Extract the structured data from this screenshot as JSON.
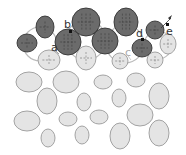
{
  "colors": {
    "background": "#ffffff",
    "dark_fill": "#6b6b6b",
    "dark_stroke": "#333333",
    "light_fill": "#e4e4e4",
    "light_stroke": "#9a9a9a",
    "ring_stroke": "#bbbbbb",
    "dash": "#444444",
    "light_dash": "#888888"
  },
  "labels": {
    "a": "a",
    "b": "b",
    "c": "c",
    "d": "d",
    "e": "e"
  },
  "dark_ellipses": [
    {
      "cx": 27,
      "cy": 43,
      "rx": 10,
      "ry": 9
    },
    {
      "cx": 45,
      "cy": 27,
      "rx": 9,
      "ry": 11
    },
    {
      "cx": 68,
      "cy": 42,
      "rx": 13,
      "ry": 13
    },
    {
      "cx": 86,
      "cy": 22,
      "rx": 14,
      "ry": 14
    },
    {
      "cx": 105,
      "cy": 41,
      "rx": 13,
      "ry": 13
    },
    {
      "cx": 126,
      "cy": 22,
      "rx": 12,
      "ry": 14
    },
    {
      "cx": 142,
      "cy": 48,
      "rx": 10,
      "ry": 9
    },
    {
      "cx": 155,
      "cy": 30,
      "rx": 9,
      "ry": 9
    }
  ],
  "light_top_ellipses": [
    {
      "cx": 49,
      "cy": 60,
      "rx": 11,
      "ry": 10
    },
    {
      "cx": 86,
      "cy": 58,
      "rx": 10,
      "ry": 12
    },
    {
      "cx": 120,
      "cy": 61,
      "rx": 8,
      "ry": 8
    },
    {
      "cx": 155,
      "cy": 60,
      "rx": 8,
      "ry": 8
    },
    {
      "cx": 168,
      "cy": 44,
      "rx": 8,
      "ry": 10
    }
  ],
  "light_ellipses": [
    {
      "cx": 29,
      "cy": 82,
      "rx": 13,
      "ry": 10
    },
    {
      "cx": 66,
      "cy": 82,
      "rx": 13,
      "ry": 11
    },
    {
      "cx": 103,
      "cy": 82,
      "rx": 9,
      "ry": 7
    },
    {
      "cx": 136,
      "cy": 80,
      "rx": 9,
      "ry": 7
    },
    {
      "cx": 47,
      "cy": 101,
      "rx": 10,
      "ry": 13
    },
    {
      "cx": 84,
      "cy": 102,
      "rx": 7,
      "ry": 9
    },
    {
      "cx": 119,
      "cy": 98,
      "rx": 7,
      "ry": 9
    },
    {
      "cx": 159,
      "cy": 96,
      "rx": 10,
      "ry": 13
    },
    {
      "cx": 27,
      "cy": 121,
      "rx": 13,
      "ry": 10
    },
    {
      "cx": 68,
      "cy": 119,
      "rx": 9,
      "ry": 7
    },
    {
      "cx": 99,
      "cy": 117,
      "rx": 9,
      "ry": 7
    },
    {
      "cx": 140,
      "cy": 115,
      "rx": 13,
      "ry": 11
    },
    {
      "cx": 48,
      "cy": 138,
      "rx": 7,
      "ry": 9
    },
    {
      "cx": 82,
      "cy": 135,
      "rx": 7,
      "ry": 9
    },
    {
      "cx": 120,
      "cy": 136,
      "rx": 10,
      "ry": 13
    },
    {
      "cx": 159,
      "cy": 133,
      "rx": 10,
      "ry": 13
    }
  ],
  "rings": [
    {
      "cx": 40,
      "cy": 44,
      "r": 17
    },
    {
      "cx": 86,
      "cy": 40,
      "r": 20
    },
    {
      "cx": 125,
      "cy": 44,
      "r": 19
    },
    {
      "cx": 158,
      "cy": 45,
      "r": 14
    }
  ]
}
